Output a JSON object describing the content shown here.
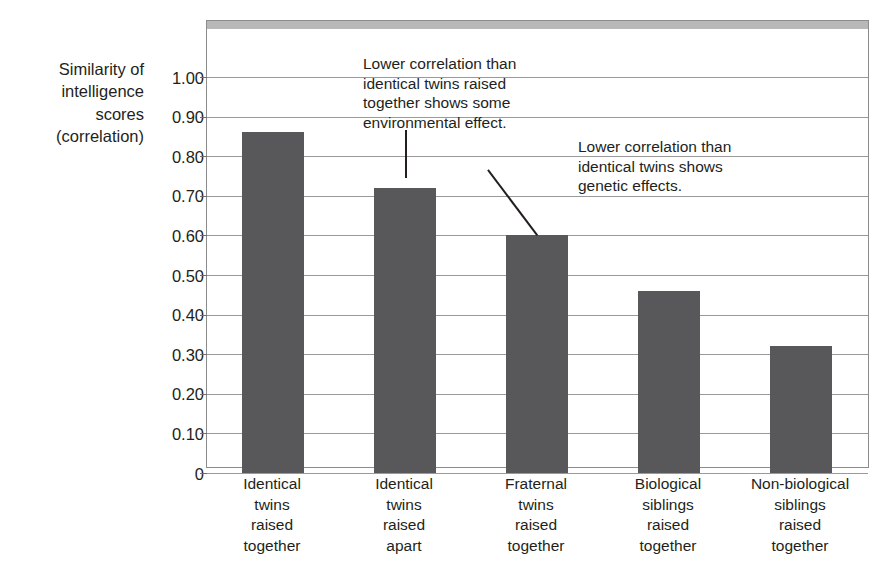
{
  "chart_data": {
    "type": "bar",
    "title": "",
    "xlabel": "",
    "ylabel": "Similarity of intelligence scores (correlation)",
    "ylim": [
      0,
      1.0
    ],
    "grid": true,
    "legend": "none",
    "categories": [
      "Identical twins raised together",
      "Identical twins raised apart",
      "Fraternal twins raised together",
      "Biological siblings raised together",
      "Non-biological siblings raised together"
    ],
    "category_lines": [
      [
        "Identical",
        "twins",
        "raised",
        "together"
      ],
      [
        "Identical",
        "twins",
        "raised",
        "apart"
      ],
      [
        "Fraternal",
        "twins",
        "raised",
        "together"
      ],
      [
        "Biological",
        "siblings",
        "raised",
        "together"
      ],
      [
        "Non-biological",
        "siblings",
        "raised",
        "together"
      ]
    ],
    "values": [
      0.86,
      0.72,
      0.6,
      0.46,
      0.32
    ],
    "ytick_values": [
      1.0,
      0.9,
      0.8,
      0.7,
      0.6,
      0.5,
      0.4,
      0.3,
      0.2,
      0.1,
      0
    ],
    "ytick_labels": [
      "1.00",
      "0.90",
      "0.80",
      "0.70",
      "0.60",
      "0.50",
      "0.40",
      "0.30",
      "0.20",
      "0.10",
      "0"
    ],
    "bar_color": "#58585a",
    "gridline_color": "#9a9a9a",
    "frame_color": "#8c8c8c",
    "annotations": [
      {
        "id": "environmental-effect",
        "lines": [
          "Lower correlation than",
          "identical twins raised",
          "together shows some",
          "environmental effect."
        ],
        "points_to_category": "Identical twins raised apart"
      },
      {
        "id": "genetic-effects",
        "lines": [
          "Lower correlation than",
          "identical twins shows",
          "genetic effects."
        ],
        "points_to_category": "Fraternal twins raised together"
      }
    ]
  },
  "axis_title": {
    "lines": [
      "Similarity of",
      "intelligence",
      "scores",
      "(correlation)"
    ]
  }
}
